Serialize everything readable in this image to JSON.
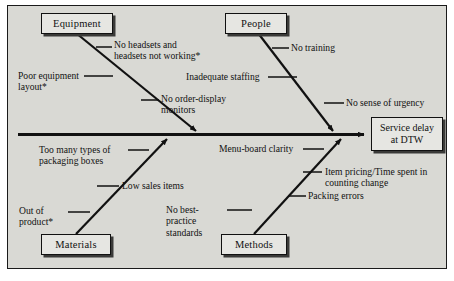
{
  "diagram": {
    "type": "fishbone-cause-and-effect",
    "effect": {
      "line1": "Service delay",
      "line2": "at DTW"
    },
    "categories": [
      {
        "id": "equipment",
        "label": "Equipment",
        "position": "top-left"
      },
      {
        "id": "people",
        "label": "People",
        "position": "top-right"
      },
      {
        "id": "materials",
        "label": "Materials",
        "position": "bottom-left"
      },
      {
        "id": "methods",
        "label": "Methods",
        "position": "bottom-right"
      }
    ],
    "causes": {
      "equipment": [
        {
          "id": "no-headsets",
          "text": "No headsets and\nheadsets not working*"
        },
        {
          "id": "poor-equipment-layout",
          "text": "Poor equipment\nlayout*"
        },
        {
          "id": "no-order-display-monitors",
          "text": "No order-display\nmonitors"
        }
      ],
      "people": [
        {
          "id": "no-training",
          "text": "No training"
        },
        {
          "id": "inadequate-staffing",
          "text": "Inadequate staffing"
        },
        {
          "id": "no-sense-of-urgency",
          "text": "No sense of urgency"
        }
      ],
      "materials": [
        {
          "id": "too-many-packaging-boxes",
          "text": "Too many types of\npackaging boxes"
        },
        {
          "id": "low-sales-items",
          "text": "Low sales items"
        },
        {
          "id": "out-of-product",
          "text": "Out of\nproduct*"
        }
      ],
      "methods": [
        {
          "id": "menu-board-clarity",
          "text": "Menu-board clarity"
        },
        {
          "id": "item-pricing-counting-change",
          "text": "Item pricing/Time spent in\ncounting change"
        },
        {
          "id": "packing-errors",
          "text": "Packing errors"
        },
        {
          "id": "no-best-practice-standards",
          "text": "No best-practice\nstandards"
        }
      ]
    },
    "colors": {
      "background": "#d9d9d4",
      "box_fill": "#e6e6e2",
      "line": "#111111",
      "shadow": "#3a3a38",
      "page": "#ffffff"
    }
  }
}
